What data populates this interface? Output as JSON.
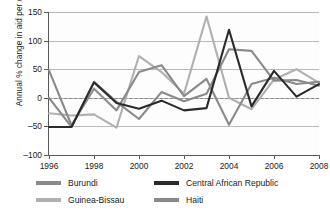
{
  "chart_data": {
    "type": "line",
    "title": "",
    "xlabel": "",
    "ylabel": "Annual % change in aid per capita",
    "xlim": [
      1996,
      2008
    ],
    "ylim": [
      -100,
      150
    ],
    "yticks": [
      150,
      100,
      50,
      0,
      -50,
      -100
    ],
    "xticks": [
      1996,
      1998,
      2000,
      2002,
      2004,
      2006,
      2008
    ],
    "grid": true,
    "zero_reference_line": 0,
    "legend_position": "below",
    "x": [
      1996,
      1997,
      1998,
      1999,
      2000,
      2001,
      2002,
      2003,
      2004,
      2005,
      2006,
      2007,
      2008
    ],
    "series": [
      {
        "name": "Burundi",
        "color": "#8a8a8c",
        "values": [
          0,
          -51,
          28,
          -7,
          -37,
          10,
          -6,
          7,
          85,
          82,
          30,
          31,
          21
        ]
      },
      {
        "name": "Central African Republic",
        "color": "#2b2b2d",
        "values": [
          -51,
          -51,
          27,
          -9,
          -19,
          -5,
          -22,
          -18,
          119,
          -15,
          47,
          2,
          24
        ]
      },
      {
        "name": "Guinea-Bissau",
        "color": "#b0b0b2",
        "values": [
          -27,
          -31,
          -29,
          -52,
          73,
          45,
          7,
          142,
          0,
          -20,
          32,
          50,
          26
        ]
      },
      {
        "name": "Haiti",
        "color": "#8a8a8c",
        "values": [
          48,
          -48,
          16,
          -22,
          45,
          57,
          3,
          33,
          -47,
          24,
          35,
          24,
          28
        ]
      }
    ]
  },
  "legend": {
    "items": [
      {
        "label": "Burundi"
      },
      {
        "label": "Central African Republic"
      },
      {
        "label": "Guinea-Bissau"
      },
      {
        "label": "Haiti"
      }
    ]
  },
  "axes": {
    "y_title": "Annual % change in aid per capita"
  }
}
